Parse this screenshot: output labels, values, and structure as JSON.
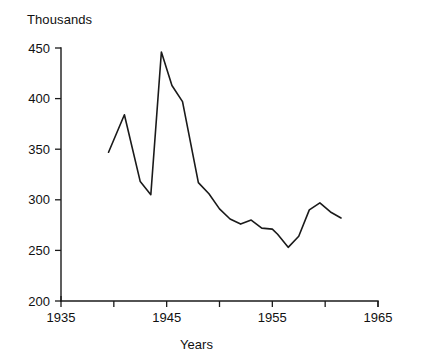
{
  "chart_data": {
    "type": "line",
    "title": "",
    "subtitle": "",
    "unit_label": "Thousands",
    "xlabel": "Years",
    "ylabel": "",
    "xlim": [
      1935,
      1965
    ],
    "ylim": [
      200,
      450
    ],
    "grid": false,
    "legend": null,
    "x_ticks": [
      1935,
      1940,
      1945,
      1950,
      1955,
      1960,
      1965
    ],
    "x_tick_labels": [
      "1935",
      "",
      "1945",
      "",
      "1955",
      "",
      "1965"
    ],
    "y_ticks": [
      200,
      250,
      300,
      350,
      400,
      450
    ],
    "y_tick_labels": [
      "200",
      "250",
      "300",
      "350",
      "400",
      "450"
    ],
    "series": [
      {
        "name": "value",
        "color": "#1a1a1a",
        "x": [
          1939.5,
          1941.0,
          1942.5,
          1943.5,
          1944.5,
          1945.5,
          1946.5,
          1948.0,
          1949.0,
          1950.0,
          1951.0,
          1952.0,
          1953.0,
          1954.0,
          1955.0,
          1955.5,
          1956.5,
          1957.5,
          1958.5,
          1959.5,
          1960.5,
          1961.5
        ],
        "y": [
          347,
          384,
          318,
          305,
          446,
          413,
          397,
          317,
          306,
          291,
          281,
          276,
          280,
          272,
          271,
          266,
          253,
          264,
          290,
          297,
          288,
          282
        ]
      }
    ]
  },
  "axis": {
    "x_title": "Years",
    "y_unit": "Thousands"
  }
}
